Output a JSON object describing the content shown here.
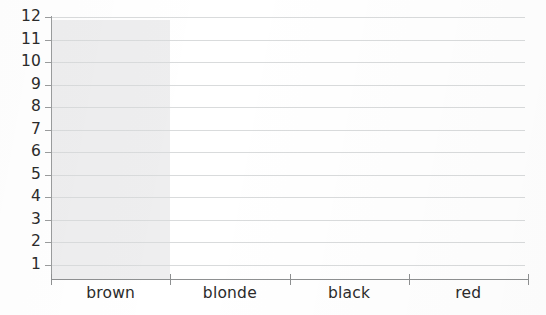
{
  "chart_data": {
    "type": "bar",
    "title": "",
    "subtitle": "",
    "xlabel": "",
    "ylabel": "",
    "categories": [
      "brown",
      "blonde",
      "black",
      "red"
    ],
    "values": [
      null,
      null,
      null,
      null
    ],
    "series": [
      {
        "name": "",
        "values": [
          null,
          null,
          null,
          null
        ]
      }
    ],
    "ytick_labels": [
      "12",
      "11",
      "10",
      "9",
      "8",
      "7",
      "6",
      "5",
      "4",
      "3",
      "2",
      "1"
    ],
    "ytick_values": [
      12,
      11,
      10,
      9,
      8,
      7,
      6,
      5,
      4,
      3,
      2,
      1
    ],
    "ylim": [
      0,
      12
    ],
    "grid": "horizontal",
    "legend": "none",
    "annotations": [
      {
        "name": "highlighted-column-band",
        "category": "brown",
        "color": "#ededee"
      }
    ],
    "colors": {
      "background": "#ffffff",
      "gridline": "#d9dbdc",
      "axis": "#8e9091",
      "text": "#2b2b2b",
      "highlight_band": "#ededee"
    }
  }
}
